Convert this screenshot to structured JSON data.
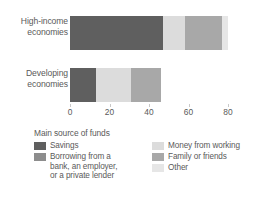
{
  "chart_data": {
    "type": "bar",
    "orientation": "horizontal",
    "stacked": true,
    "title": "",
    "xlabel": "",
    "ylabel": "",
    "categories": [
      "High-income economies",
      "Developing economies"
    ],
    "category_lines": [
      [
        "High-income",
        "economies"
      ],
      [
        "Developing",
        "economies"
      ]
    ],
    "series": [
      {
        "name": "Savings",
        "color": "#5f5f5f",
        "values": [
          47,
          13
        ]
      },
      {
        "name": "Money from working",
        "color": "#dcdcdc",
        "values": [
          11,
          18
        ]
      },
      {
        "name": "Family or friends",
        "color": "#a8a8a8",
        "values": [
          19,
          15
        ]
      },
      {
        "name": "Other",
        "color": "#e6e6e6",
        "values": [
          3,
          0
        ]
      }
    ],
    "totals": [
      80,
      46
    ],
    "xlim": [
      0,
      80
    ],
    "xticks": [
      0,
      20,
      40,
      60,
      80
    ],
    "xtick_labels": [
      "0",
      "20",
      "40",
      "60",
      "80"
    ],
    "grid": false,
    "legend_position": "below"
  },
  "legend": {
    "title": "Main source of funds",
    "left_items": [
      {
        "label": "Savings",
        "continuation": [],
        "color": "#5f5f5f"
      },
      {
        "label": "Borrowing from a",
        "continuation": [
          "bank, an employer,",
          "or a private lender"
        ],
        "color": "#8d8d8d"
      }
    ],
    "right_items": [
      {
        "label": "Money from working",
        "continuation": [],
        "color": "#dcdcdc"
      },
      {
        "label": "Family or friends",
        "continuation": [],
        "color": "#a8a8a8"
      },
      {
        "label": "Other",
        "continuation": [],
        "color": "#e6e6e6"
      }
    ]
  },
  "colors": {
    "background": "#ffffff",
    "text": "#5a5a5a",
    "tick": "#c8c8c8",
    "savings": "#5f5f5f",
    "borrowing": "#8d8d8d",
    "money_from_working": "#dcdcdc",
    "family_or_friends": "#a8a8a8",
    "other": "#e6e6e6"
  }
}
